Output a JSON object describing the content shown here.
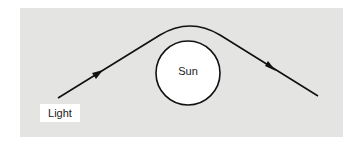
{
  "diagram": {
    "labels": {
      "light": "Light",
      "sun": "Sun"
    },
    "colors": {
      "panel": "#e4e4e2",
      "stroke": "#111111",
      "sun_fill": "#ffffff"
    }
  }
}
